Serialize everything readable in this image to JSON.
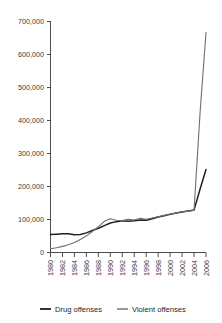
{
  "chart_data": {
    "type": "line",
    "title": "",
    "xlabel": "",
    "ylabel": "",
    "x": [
      1980,
      1981,
      1982,
      1983,
      1984,
      1985,
      1986,
      1987,
      1988,
      1989,
      1990,
      1991,
      1992,
      1993,
      1994,
      1995,
      1996,
      1997,
      1998,
      1999,
      2000,
      2001,
      2002,
      2003,
      2004,
      2005,
      2006
    ],
    "xlim": [
      1980,
      2006
    ],
    "ylim": [
      0,
      700000
    ],
    "yticks": [
      0,
      100000,
      200000,
      300000,
      400000,
      500000,
      600000,
      700000
    ],
    "ytick_labels": [
      "0",
      "100,000",
      "200,000",
      "300,000",
      "400,000",
      "500,000",
      "600,000",
      "700,000"
    ],
    "xticks": [
      1980,
      1982,
      1984,
      1986,
      1988,
      1990,
      1992,
      1994,
      1996,
      1998,
      2000,
      2002,
      2004,
      2006
    ],
    "xtick_labels": [
      "1980",
      "1982",
      "1984",
      "1986",
      "1988",
      "1990",
      "1992",
      "1994",
      "1996",
      "1998",
      "2000",
      "2002",
      "2004",
      "2006"
    ],
    "grid": false,
    "legend_position": "bottom",
    "series": [
      {
        "name": "Drug offenses",
        "color": "#231f20",
        "width": 1.5,
        "values": [
          53000,
          54000,
          55000,
          55000,
          52000,
          53000,
          58000,
          65000,
          72000,
          80000,
          88000,
          92000,
          95000,
          93000,
          95000,
          97000,
          96000,
          101000,
          106000,
          110000,
          114000,
          118000,
          121000,
          124000,
          127000,
          190000,
          250000
        ]
      },
      {
        "name": "Violent offenses",
        "color": "#6d6e71",
        "width": 1.1,
        "values": [
          10000,
          13000,
          17000,
          22000,
          29000,
          38000,
          49000,
          62000,
          76000,
          93000,
          101000,
          96000,
          95000,
          99000,
          97000,
          102000,
          99000,
          103000,
          107000,
          111000,
          115000,
          118000,
          122000,
          124000,
          126000,
          420000,
          665000
        ]
      }
    ]
  },
  "legend": {
    "items": [
      {
        "label": "Drug offenses"
      },
      {
        "label": "Violent offenses"
      }
    ]
  }
}
